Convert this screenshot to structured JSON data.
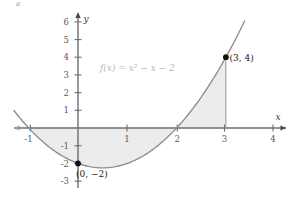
{
  "figure": {
    "corner_label": "a",
    "background": "#ffffff"
  },
  "axes": {
    "x_name": "x",
    "y_name": "y",
    "axis_color": "#6e6e72",
    "x_ticks": [
      "-1",
      "1",
      "2",
      "3",
      "4"
    ],
    "y_ticks": [
      "6",
      "5",
      "4",
      "3",
      "2",
      "1",
      "-1",
      "-2",
      "-3"
    ]
  },
  "labels": {
    "function": "f(x) = x² − x − 2",
    "point_max": "(3, 4)",
    "point_intercept": "(0, −2)"
  },
  "chart_data": {
    "type": "line",
    "title": "",
    "subtitle": "",
    "xlabel": "x",
    "ylabel": "y",
    "xlim": [
      -1.3,
      4.4
    ],
    "ylim": [
      -3.2,
      6.5
    ],
    "grid": false,
    "legend": "none",
    "curve_color": "#8d8d91",
    "fill_color": "#ececec",
    "marker_color": "#111111",
    "function_expression": "f(x) = x^2 - x - 2",
    "x_tick_values": [
      -1,
      1,
      2,
      3,
      4
    ],
    "y_tick_values": [
      6,
      5,
      4,
      3,
      2,
      1,
      -1,
      -2,
      -3
    ],
    "shaded_region": {
      "from_x": -1,
      "to_x": 3,
      "description": "region between curve and x-axis from x=-1 to x=3"
    },
    "annotations": [
      {
        "label": "(3, 4)",
        "x": 3,
        "y": 4
      },
      {
        "label": "(0, −2)",
        "x": 0,
        "y": -2
      },
      {
        "label": "f(x) = x² − x − 2",
        "x": 1.0,
        "y": 3.2
      }
    ],
    "series": [
      {
        "name": "f(x) = x^2 - x - 2",
        "x": [
          -1.25,
          -1.0,
          -0.75,
          -0.5,
          -0.25,
          0.0,
          0.25,
          0.5,
          0.75,
          1.0,
          1.25,
          1.5,
          1.75,
          2.0,
          2.25,
          2.5,
          2.75,
          3.0,
          3.25,
          3.4
        ],
        "y": [
          0.81,
          0.0,
          -0.69,
          -1.25,
          -1.69,
          -2.0,
          -2.19,
          -2.25,
          -2.19,
          -2.0,
          -1.69,
          -1.25,
          -0.69,
          0.0,
          0.81,
          1.75,
          2.81,
          4.0,
          5.31,
          6.16
        ]
      }
    ],
    "points": [
      {
        "x": 3,
        "y": 4,
        "label": "(3, 4)"
      },
      {
        "x": 0,
        "y": -2,
        "label": "(0, −2)"
      }
    ],
    "roots": [
      -1,
      2
    ]
  }
}
